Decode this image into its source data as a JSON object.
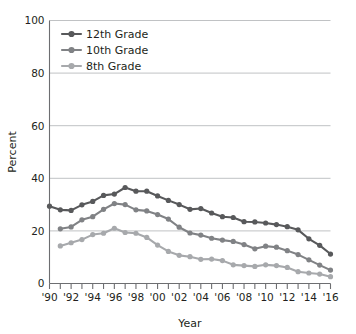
{
  "chart_data": {
    "type": "line",
    "title": "",
    "xlabel": "Year",
    "ylabel": "Percent",
    "xlim": [
      1990,
      2016
    ],
    "ylim": [
      0,
      100
    ],
    "grid": true,
    "legend_position": "top-left-inside",
    "x": [
      1990,
      1991,
      1992,
      1993,
      1994,
      1995,
      1996,
      1997,
      1998,
      1999,
      2000,
      2001,
      2002,
      2003,
      2004,
      2005,
      2006,
      2007,
      2008,
      2009,
      2010,
      2011,
      2012,
      2013,
      2014,
      2015,
      2016
    ],
    "x_tick_labels": [
      "'90",
      "'92",
      "'94",
      "'96",
      "'98",
      "'00",
      "'02",
      "'04",
      "'06",
      "'08",
      "'10",
      "'12",
      "'14",
      "'16"
    ],
    "x_tick_values": [
      1990,
      1992,
      1994,
      1996,
      1998,
      2000,
      2002,
      2004,
      2006,
      2008,
      2010,
      2012,
      2014,
      2016
    ],
    "y_tick_labels": [
      "0",
      "20",
      "40",
      "60",
      "80",
      "100"
    ],
    "y_tick_values": [
      0,
      20,
      40,
      60,
      80,
      100
    ],
    "series": [
      {
        "name": "12th Grade",
        "color": "#58595b",
        "values": [
          29.4,
          28.0,
          27.8,
          29.9,
          31.2,
          33.5,
          34.0,
          36.5,
          35.1,
          35.1,
          33.3,
          31.6,
          30.0,
          28.2,
          28.5,
          26.8,
          25.4,
          25.1,
          23.5,
          23.4,
          23.0,
          22.4,
          21.6,
          20.4,
          17.0,
          14.5,
          11.2
        ]
      },
      {
        "name": "10th Grade",
        "color": "#808285",
        "values": [
          null,
          20.8,
          21.5,
          24.2,
          25.4,
          28.2,
          30.4,
          30.0,
          28.0,
          27.6,
          26.2,
          24.5,
          21.4,
          19.2,
          18.4,
          17.2,
          16.5,
          16.0,
          14.8,
          13.2,
          14.2,
          13.8,
          12.5,
          11.0,
          9.0,
          7.0,
          5.1
        ]
      },
      {
        "name": "8th Grade",
        "color": "#a7a9ac",
        "values": [
          null,
          14.3,
          15.5,
          16.7,
          18.6,
          19.1,
          21.0,
          19.4,
          19.1,
          17.5,
          14.6,
          12.2,
          10.7,
          10.2,
          9.2,
          9.3,
          8.7,
          7.1,
          6.8,
          6.5,
          7.1,
          6.8,
          6.1,
          4.5,
          4.0,
          3.6,
          2.6
        ]
      }
    ]
  },
  "legend": {
    "items": [
      {
        "label": "12th Grade",
        "color": "#58595b"
      },
      {
        "label": "10th Grade",
        "color": "#808285"
      },
      {
        "label": "8th Grade",
        "color": "#a7a9ac"
      }
    ]
  },
  "axes": {
    "x_title": "Year",
    "y_title": "Percent"
  }
}
